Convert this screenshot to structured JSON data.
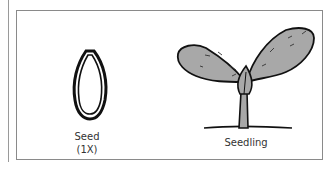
{
  "figure": {
    "panels": [
      {
        "name": "seed",
        "label_line1": "Seed",
        "label_line2": "(1X)",
        "icon": "seed-icon"
      },
      {
        "name": "seedling",
        "label": "Seedling",
        "icon": "seedling-icon"
      }
    ],
    "colors": {
      "border": "#8a8a8a",
      "outline": "#111111",
      "leaf_fill": "#a8a8a8",
      "text": "#333333"
    }
  }
}
